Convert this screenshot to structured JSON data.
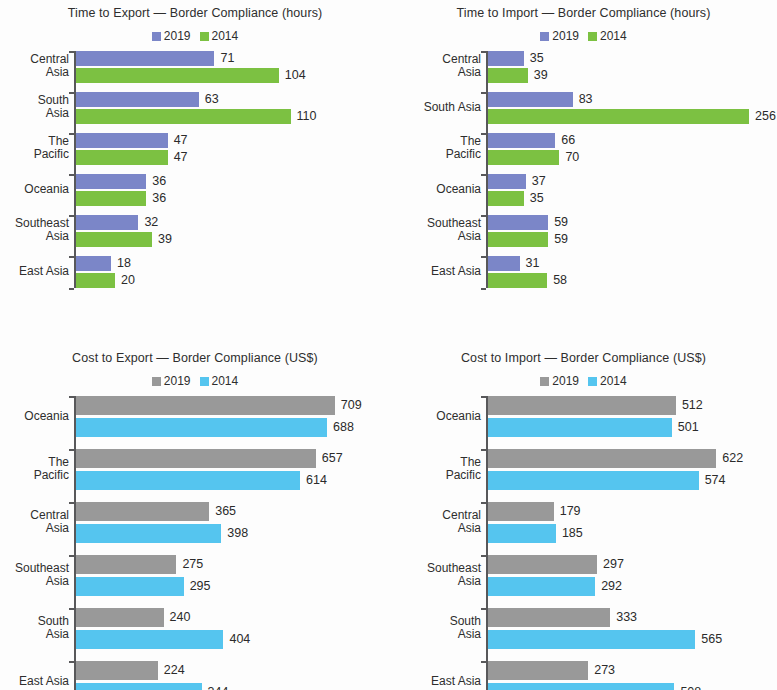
{
  "figure": {
    "background": "#fdfdfd",
    "panel_count": 4
  },
  "colors": {
    "blue_2019": "#7b86c8",
    "green_2014": "#7cc142",
    "gray_2019": "#999999",
    "cyan_2014": "#55c5ef",
    "axis": "#58585a",
    "text": "#2b2b2b"
  },
  "chart_data": [
    {
      "id": "time-export",
      "type": "bar",
      "orientation": "horizontal",
      "title": "Time to Export — Border Compliance (hours)",
      "xlabel": "",
      "ylabel": "",
      "grid": false,
      "legend_position": "top-center",
      "legend": [
        "2019",
        "2014"
      ],
      "series_colors": [
        "#7b86c8",
        "#7cc142"
      ],
      "categories": [
        "Central\nAsia",
        "South\nAsia",
        "The\nPacific",
        "Oceania",
        "Southeast\nAsia",
        "East Asia"
      ],
      "series": [
        {
          "name": "2019",
          "values": [
            71,
            63,
            47,
            36,
            32,
            18
          ]
        },
        {
          "name": "2014",
          "values": [
            104,
            110,
            47,
            36,
            39,
            20
          ]
        }
      ],
      "xlim": [
        0,
        160
      ],
      "px_per_unit": 1.95
    },
    {
      "id": "time-import",
      "type": "bar",
      "orientation": "horizontal",
      "title": "Time to Import — Border Compliance (hours)",
      "xlabel": "",
      "ylabel": "",
      "grid": false,
      "legend_position": "top-center",
      "legend": [
        "2019",
        "2014"
      ],
      "series_colors": [
        "#7b86c8",
        "#7cc142"
      ],
      "categories": [
        "Central\nAsia",
        "South Asia",
        "The\nPacific",
        "Oceania",
        "Southeast\nAsia",
        "East Asia"
      ],
      "series": [
        {
          "name": "2019",
          "values": [
            35,
            83,
            66,
            37,
            59,
            31
          ]
        },
        {
          "name": "2014",
          "values": [
            39,
            256,
            70,
            35,
            59,
            58
          ]
        }
      ],
      "xlim": [
        0,
        290
      ],
      "px_per_unit": 1.02
    },
    {
      "id": "cost-export",
      "type": "bar",
      "orientation": "horizontal",
      "title": "Cost to Export — Border Compliance (US$)",
      "xlabel": "",
      "ylabel": "",
      "grid": false,
      "legend_position": "top-center",
      "legend": [
        "2019",
        "2014"
      ],
      "series_colors": [
        "#999999",
        "#55c5ef"
      ],
      "categories": [
        "Oceania",
        "The\nPacific",
        "Central\nAsia",
        "Southeast\nAsia",
        "South\nAsia",
        "East Asia"
      ],
      "series": [
        {
          "name": "2019",
          "values": [
            709,
            657,
            365,
            275,
            240,
            224
          ]
        },
        {
          "name": "2014",
          "values": [
            688,
            614,
            398,
            295,
            404,
            344
          ]
        }
      ],
      "xlim": [
        0,
        820
      ],
      "px_per_unit": 0.365
    },
    {
      "id": "cost-import",
      "type": "bar",
      "orientation": "horizontal",
      "title": "Cost to Import — Border Compliance (US$)",
      "xlabel": "",
      "ylabel": "",
      "grid": false,
      "legend_position": "top-center",
      "legend": [
        "2019",
        "2014"
      ],
      "series_colors": [
        "#999999",
        "#55c5ef"
      ],
      "categories": [
        "Oceania",
        "The\nPacific",
        "Central\nAsia",
        "Southeast\nAsia",
        "South\nAsia",
        "East Asia"
      ],
      "series": [
        {
          "name": "2019",
          "values": [
            512,
            622,
            179,
            297,
            333,
            273
          ]
        },
        {
          "name": "2014",
          "values": [
            501,
            574,
            185,
            292,
            565,
            508
          ]
        }
      ],
      "xlim": [
        0,
        800
      ],
      "px_per_unit": 0.367
    }
  ],
  "panels": [
    {
      "key": "time-export",
      "label_width": 68,
      "axis_x": 74,
      "bar_height": 15,
      "pair_gap": 2,
      "group_gap": 9,
      "top_offset": 0
    },
    {
      "key": "time-import",
      "label_width": 90,
      "axis_x": 96,
      "bar_height": 15,
      "pair_gap": 2,
      "group_gap": 9,
      "top_offset": 0
    },
    {
      "key": "cost-export",
      "label_width": 68,
      "axis_x": 74,
      "bar_height": 19,
      "pair_gap": 3,
      "group_gap": 12,
      "top_offset": 0
    },
    {
      "key": "cost-import",
      "label_width": 90,
      "axis_x": 96,
      "bar_height": 19,
      "pair_gap": 3,
      "group_gap": 12,
      "top_offset": 0
    }
  ]
}
